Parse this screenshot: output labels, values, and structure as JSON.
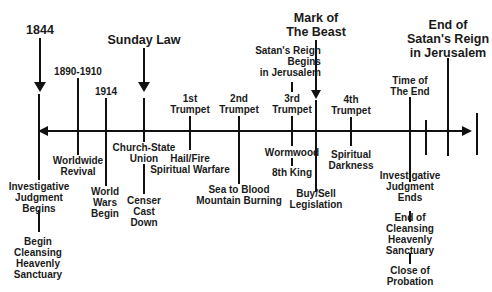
{
  "diagram": {
    "type": "timeline",
    "axis": {
      "direction": "both-arrows"
    },
    "events_above": [
      {
        "id": "1844",
        "label": "1844",
        "marker": "arrow"
      },
      {
        "id": "1890-1910",
        "label": "1890-1910",
        "marker": "line"
      },
      {
        "id": "1914",
        "label": "1914",
        "marker": "line"
      },
      {
        "id": "sunday-law",
        "label": "Sunday Law",
        "marker": "arrow"
      },
      {
        "id": "1st-trumpet",
        "label": "1st\nTrumpet",
        "marker": "line"
      },
      {
        "id": "2nd-trumpet",
        "label": "2nd\nTrumpet",
        "marker": "line"
      },
      {
        "id": "satans-reign-begins",
        "label": "Satan's Reign\nBegins\nin Jerusalem",
        "marker": "line"
      },
      {
        "id": "3rd-trumpet",
        "label": "3rd\nTrumpet",
        "marker": "line"
      },
      {
        "id": "mark-of-the-beast",
        "label": "Mark of\nThe Beast",
        "marker": "arrow"
      },
      {
        "id": "4th-trumpet",
        "label": "4th\nTrumpet",
        "marker": "line"
      },
      {
        "id": "time-of-the-end",
        "label": "Time of\nThe End",
        "marker": "line"
      },
      {
        "id": "end-of-satans-reign",
        "label": "End of\nSatan's Reign\nin Jerusalem",
        "marker": "line"
      }
    ],
    "events_below": [
      {
        "id": "investigative-judgment-begins",
        "label": "Investigative\nJudgment\nBegins"
      },
      {
        "id": "begin-cleansing",
        "label": "Begin\nCleansing\nHeavenly\nSanctuary"
      },
      {
        "id": "worldwide-revival",
        "label": "Worldwide\nRevival"
      },
      {
        "id": "world-wars-begin",
        "label": "World\nWars\nBegin"
      },
      {
        "id": "church-state-union",
        "label": "Church-State\nUnion"
      },
      {
        "id": "censer-cast-down",
        "label": "Censer\nCast\nDown"
      },
      {
        "id": "hail-fire",
        "label": "Hail/Fire\nSpiritual Warfare"
      },
      {
        "id": "sea-to-blood",
        "label": "Sea to Blood\nMountain Burning"
      },
      {
        "id": "wormwood",
        "label": "Wormwood"
      },
      {
        "id": "8th-king",
        "label": "8th King"
      },
      {
        "id": "buy-sell",
        "label": "Buy/Sell\nLegislation"
      },
      {
        "id": "spiritual-darkness",
        "label": "Spiritual\nDarkness"
      },
      {
        "id": "investigative-judgment-ends",
        "label": "Investigative\nJudgment\nEnds"
      },
      {
        "id": "end-of-cleansing",
        "label": "End of\nCleansing\nHeavenly\nSanctuary"
      },
      {
        "id": "close-of-probation",
        "label": "Close of\nProbation"
      }
    ]
  },
  "colors": {
    "line": "#111111",
    "text": "#1a1a1a",
    "background": "#ffffff"
  }
}
